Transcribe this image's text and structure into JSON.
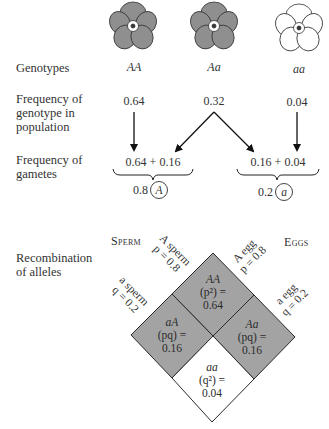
{
  "flowers": [
    {
      "genotype": "AA",
      "color": "#8f8f8f",
      "icon": "flower-dark-icon"
    },
    {
      "genotype": "Aa",
      "color": "#8f8f8f",
      "icon": "flower-dark-icon"
    },
    {
      "genotype": "aa",
      "color": "#ffffff",
      "icon": "flower-white-icon"
    }
  ],
  "rows": {
    "genotypes_label": "Genotypes",
    "frequency_genotype_label": [
      "Frequency of",
      "genotype in",
      "population"
    ],
    "frequency_gametes_label": [
      "Frequency of",
      "gametes"
    ],
    "recombination_label": [
      "Recombination",
      "of alleles"
    ]
  },
  "genotype_frequencies": {
    "AA": "0.64",
    "Aa": "0.32",
    "aa": "0.04"
  },
  "gametes": {
    "A": {
      "sum": "0.64 + 0.16",
      "total": "0.8",
      "allele": "A"
    },
    "a": {
      "sum": "0.16 + 0.04",
      "total": "0.2",
      "allele": "a"
    }
  },
  "recombination": {
    "sperm_label": "Sperm",
    "eggs_label": "Eggs",
    "A_sperm": {
      "line1": "A sperm",
      "line2": "p = 0.8"
    },
    "a_sperm": {
      "line1": "a sperm",
      "line2": "q = 0.2"
    },
    "A_egg": {
      "line1": "A egg",
      "line2": "p = 0.8"
    },
    "a_egg": {
      "line1": "a egg",
      "line2": "q = 0.2"
    },
    "cells": {
      "AA": {
        "genotype": "AA",
        "formula": "(p²) =",
        "value": "0.64"
      },
      "aA": {
        "genotype": "aA",
        "formula": "(pq) =",
        "value": "0.16"
      },
      "Aa": {
        "genotype": "Aa",
        "formula": "(pq) =",
        "value": "0.16"
      },
      "aa": {
        "genotype": "aa",
        "formula": "(q²) =",
        "value": "0.04"
      }
    }
  },
  "colors": {
    "shaded": "#a3a3a3",
    "line": "#2a2a2a",
    "white": "#ffffff"
  }
}
